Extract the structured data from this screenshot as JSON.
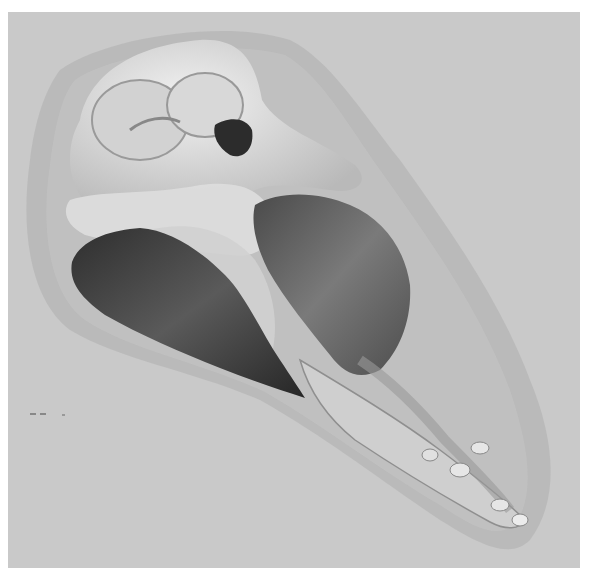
{
  "figure": {
    "colors": {
      "background": "#c9c9c9",
      "skin": "#b5b5b5",
      "bone": "#e4e4e4",
      "muscle_dark": "#3e3e3e",
      "muscle_mid": "#6a6a6a"
    }
  }
}
